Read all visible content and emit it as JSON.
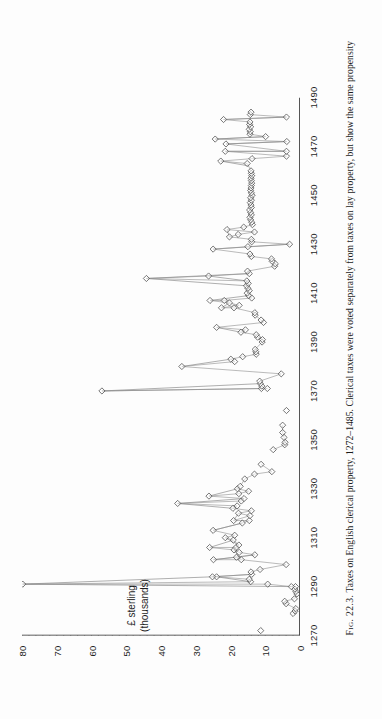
{
  "figure": {
    "number_label": "Fig. 22.3.",
    "caption_text": "Taxes on English clerical property, 1272–1485. Clerical taxes were voted separately from taxes on lay property, but show the same propensity",
    "orientation": "rotated-90-ccw"
  },
  "axes": {
    "y_title_line1": "£ sterling",
    "y_title_line2": "(thousands)",
    "y_ticks": [
      "0",
      "10",
      "20",
      "30",
      "40",
      "50",
      "60",
      "70",
      "80"
    ],
    "x_ticks": [
      "1270",
      "1290",
      "1310",
      "1330",
      "1350",
      "1370",
      "1390",
      "1410",
      "1430",
      "1450",
      "1470",
      "1490"
    ]
  },
  "style": {
    "axis_color": "#2b2b2b",
    "marker_stroke": "#4a4a4a",
    "line_color": "#8d8d8d",
    "background": "#fdfdfd"
  },
  "chart_data": {
    "type": "scatter",
    "title": "Taxes on English clerical property, 1272–1485",
    "xlabel": "",
    "ylabel": "£ sterling (thousands)",
    "xlim": [
      1270,
      1490
    ],
    "ylim": [
      0,
      80
    ],
    "grid": false,
    "legend": null,
    "marker": "open-diamond",
    "series": [
      {
        "name": "Clerical tax yield",
        "points": [
          [
            1272,
            11.3
          ],
          [
            1279,
            2.0
          ],
          [
            1280,
            1.4
          ],
          [
            1281,
            1.2
          ],
          [
            1283,
            4.0
          ],
          [
            1284,
            4.4
          ],
          [
            1285,
            1.6
          ],
          [
            1287,
            0.9
          ],
          [
            1288,
            1.2
          ],
          [
            1289,
            1.5
          ],
          [
            1290,
            1.3
          ],
          [
            1290,
            2.5
          ],
          [
            1291,
            9.3
          ],
          [
            1291,
            79.8
          ],
          [
            1292,
            14.2
          ],
          [
            1293,
            14.6
          ],
          [
            1294,
            24.0
          ],
          [
            1294,
            25.2
          ],
          [
            1295,
            13.9
          ],
          [
            1296,
            14.1
          ],
          [
            1297,
            11.5
          ],
          [
            1299,
            4.0
          ],
          [
            1301,
            16.9
          ],
          [
            1301,
            24.9
          ],
          [
            1302,
            18.3
          ],
          [
            1303,
            13.0
          ],
          [
            1304,
            17.5
          ],
          [
            1305,
            19.0
          ],
          [
            1306,
            26.0
          ],
          [
            1306,
            18.4
          ],
          [
            1307,
            17.6
          ],
          [
            1309,
            19.2
          ],
          [
            1310,
            21.5
          ],
          [
            1311,
            18.8
          ],
          [
            1313,
            25.0
          ],
          [
            1316,
            16.6
          ],
          [
            1317,
            14.6
          ],
          [
            1317,
            19.1
          ],
          [
            1319,
            14.4
          ],
          [
            1320,
            17.7
          ],
          [
            1321,
            14.0
          ],
          [
            1322,
            19.3
          ],
          [
            1323,
            18.1
          ],
          [
            1324,
            35.2
          ],
          [
            1325,
            16.9
          ],
          [
            1326,
            16.1
          ],
          [
            1327,
            26.2
          ],
          [
            1328,
            17.6
          ],
          [
            1329,
            14.8
          ],
          [
            1330,
            18.0
          ],
          [
            1331,
            17.2
          ],
          [
            1334,
            15.9
          ],
          [
            1336,
            13.1
          ],
          [
            1337,
            8.1
          ],
          [
            1340,
            11.2
          ],
          [
            1346,
            7.7
          ],
          [
            1348,
            4.4
          ],
          [
            1349,
            4.3
          ],
          [
            1351,
            4.6
          ],
          [
            1353,
            5.0
          ],
          [
            1356,
            5.0
          ],
          [
            1362,
            3.9
          ],
          [
            1370,
            57.0
          ],
          [
            1371,
            9.4
          ],
          [
            1371,
            11.1
          ],
          [
            1372,
            11.0
          ],
          [
            1373,
            11.4
          ],
          [
            1374,
            11.6
          ],
          [
            1377,
            5.4
          ],
          [
            1380,
            34.0
          ],
          [
            1382,
            18.8
          ],
          [
            1383,
            19.9
          ],
          [
            1384,
            16.5
          ],
          [
            1385,
            12.6
          ],
          [
            1386,
            12.7
          ],
          [
            1387,
            12.9
          ],
          [
            1390,
            10.9
          ],
          [
            1391,
            10.8
          ],
          [
            1392,
            12.2
          ],
          [
            1393,
            12.6
          ],
          [
            1394,
            17.0
          ],
          [
            1395,
            15.7
          ],
          [
            1396,
            24.0
          ],
          [
            1398,
            10.5
          ],
          [
            1399,
            11.2
          ],
          [
            1401,
            12.9
          ],
          [
            1402,
            13.0
          ],
          [
            1404,
            19.0
          ],
          [
            1404,
            22.6
          ],
          [
            1405,
            17.5
          ],
          [
            1406,
            20.3
          ],
          [
            1407,
            25.9
          ],
          [
            1407,
            21.8
          ],
          [
            1408,
            13.9
          ],
          [
            1409,
            14.8
          ],
          [
            1410,
            15.2
          ],
          [
            1411,
            14.6
          ],
          [
            1412,
            15.0
          ],
          [
            1413,
            15.4
          ],
          [
            1414,
            14.9
          ],
          [
            1415,
            15.3
          ],
          [
            1416,
            44.2
          ],
          [
            1417,
            26.3
          ],
          [
            1418,
            14.6
          ],
          [
            1419,
            15.1
          ],
          [
            1421,
            7.3
          ],
          [
            1422,
            7.1
          ],
          [
            1423,
            8.0
          ],
          [
            1424,
            8.2
          ],
          [
            1425,
            14.0
          ],
          [
            1426,
            14.4
          ],
          [
            1428,
            25.0
          ],
          [
            1429,
            15.0
          ],
          [
            1430,
            3.0
          ],
          [
            1431,
            13.9
          ],
          [
            1432,
            14.0
          ],
          [
            1433,
            20.3
          ],
          [
            1434,
            17.8
          ],
          [
            1435,
            13.1
          ],
          [
            1436,
            21.0
          ],
          [
            1437,
            16.2
          ],
          [
            1438,
            13.7
          ],
          [
            1439,
            13.9
          ],
          [
            1440,
            14.2
          ],
          [
            1441,
            14.4
          ],
          [
            1442,
            14.0
          ],
          [
            1443,
            14.2
          ],
          [
            1444,
            14.5
          ],
          [
            1445,
            14.0
          ],
          [
            1446,
            14.1
          ],
          [
            1447,
            14.3
          ],
          [
            1448,
            14.0
          ],
          [
            1449,
            14.2
          ],
          [
            1450,
            13.8
          ],
          [
            1451,
            14.0
          ],
          [
            1452,
            14.2
          ],
          [
            1453,
            14.1
          ],
          [
            1454,
            14.0
          ],
          [
            1455,
            13.9
          ],
          [
            1456,
            14.0
          ],
          [
            1457,
            14.1
          ],
          [
            1458,
            13.9
          ],
          [
            1459,
            14.0
          ],
          [
            1460,
            14.1
          ],
          [
            1463,
            15.2
          ],
          [
            1464,
            22.8
          ],
          [
            1465,
            13.8
          ],
          [
            1466,
            3.9
          ],
          [
            1468,
            21.5
          ],
          [
            1468,
            3.9
          ],
          [
            1471,
            21.3
          ],
          [
            1472,
            3.8
          ],
          [
            1473,
            24.4
          ],
          [
            1474,
            9.9
          ],
          [
            1475,
            14.4
          ],
          [
            1476,
            14.3
          ],
          [
            1477,
            14.6
          ],
          [
            1478,
            14.2
          ],
          [
            1479,
            14.5
          ],
          [
            1480,
            14.4
          ],
          [
            1481,
            22.0
          ],
          [
            1482,
            3.9
          ],
          [
            1483,
            14.3
          ],
          [
            1484,
            14.1
          ]
        ],
        "connections": [
          [
            [
              1291,
              79.8
            ],
            [
              1290,
              2.5
            ]
          ],
          [
            [
              1291,
              79.8
            ],
            [
              1294,
              25.2
            ]
          ],
          [
            [
              1294,
              24.0
            ],
            [
              1292,
              14.2
            ]
          ],
          [
            [
              1294,
              25.2
            ],
            [
              1295,
              13.9
            ]
          ],
          [
            [
              1301,
              24.9
            ],
            [
              1303,
              13.0
            ]
          ],
          [
            [
              1301,
              16.9
            ],
            [
              1305,
              19.0
            ]
          ],
          [
            [
              1306,
              26.0
            ],
            [
              1309,
              19.2
            ]
          ],
          [
            [
              1310,
              21.5
            ],
            [
              1307,
              17.6
            ]
          ],
          [
            [
              1313,
              25.0
            ],
            [
              1316,
              16.6
            ]
          ],
          [
            [
              1317,
              19.1
            ],
            [
              1320,
              17.7
            ]
          ],
          [
            [
              1324,
              35.2
            ],
            [
              1322,
              19.3
            ]
          ],
          [
            [
              1324,
              35.2
            ],
            [
              1326,
              16.1
            ]
          ],
          [
            [
              1327,
              26.2
            ],
            [
              1330,
              18.0
            ]
          ],
          [
            [
              1370,
              57.0
            ],
            [
              1371,
              11.1
            ]
          ],
          [
            [
              1370,
              57.0
            ],
            [
              1373,
              11.4
            ]
          ],
          [
            [
              1380,
              34.0
            ],
            [
              1383,
              19.9
            ]
          ],
          [
            [
              1396,
              24.0
            ],
            [
              1394,
              17.0
            ]
          ],
          [
            [
              1404,
              22.6
            ],
            [
              1406,
              20.3
            ]
          ],
          [
            [
              1407,
              25.9
            ],
            [
              1409,
              14.8
            ]
          ],
          [
            [
              1416,
              44.2
            ],
            [
              1413,
              15.4
            ]
          ],
          [
            [
              1416,
              44.2
            ],
            [
              1418,
              14.6
            ]
          ],
          [
            [
              1417,
              26.3
            ],
            [
              1415,
              15.3
            ]
          ],
          [
            [
              1428,
              25.0
            ],
            [
              1430,
              3.0
            ]
          ],
          [
            [
              1433,
              20.3
            ],
            [
              1436,
              21.0
            ]
          ],
          [
            [
              1464,
              22.8
            ],
            [
              1462,
              14.6
            ]
          ],
          [
            [
              1468,
              21.5
            ],
            [
              1468,
              3.9
            ]
          ],
          [
            [
              1471,
              21.3
            ],
            [
              1472,
              3.8
            ]
          ],
          [
            [
              1473,
              24.4
            ],
            [
              1474,
              9.9
            ]
          ],
          [
            [
              1481,
              22.0
            ],
            [
              1482,
              3.9
            ]
          ]
        ]
      }
    ]
  }
}
